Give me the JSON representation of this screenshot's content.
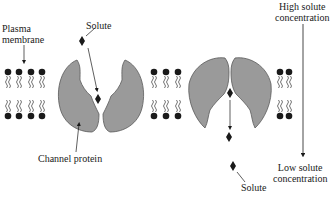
{
  "diagram": {
    "labels": {
      "plasma_membrane": [
        "Plasma",
        "membrane"
      ],
      "solute_top": "Solute",
      "channel_protein": "Channel protein",
      "solute_bottom": "Solute",
      "high_concentration": [
        "High solute",
        "concentration"
      ],
      "low_concentration": [
        "Low solute",
        "concentration"
      ]
    },
    "colors": {
      "protein_fill": "#9a9a9a",
      "protein_stroke": "#5a5a5a",
      "ink": "#1a1a1a"
    },
    "gradient_arrow_direction": "down"
  }
}
